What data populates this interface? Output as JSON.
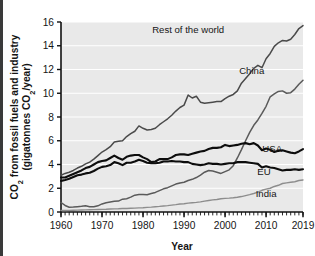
{
  "chart_data": {
    "type": "line",
    "title": "",
    "xlabel": "Year",
    "ylabel": "CO2 from fossil fuels and industry (gigatonnes CO2/year)",
    "ylabel_line1_pre": "CO",
    "ylabel_line1_sub": "2",
    "ylabel_line1_post": " from fossil fuels and industry",
    "ylabel_line2_pre": "(gigatonnes CO",
    "ylabel_line2_sub": "2",
    "ylabel_line2_post": "/year)",
    "xlim": [
      1960,
      2019
    ],
    "ylim": [
      0,
      16
    ],
    "xticks": [
      1960,
      1970,
      1980,
      1990,
      2000,
      2010,
      2019
    ],
    "xtick_labels": [
      "1960",
      "1970",
      "1980",
      "1990",
      "2000",
      "2010",
      "2019"
    ],
    "yticks": [
      0,
      2,
      4,
      6,
      8,
      10,
      12,
      14,
      16
    ],
    "ytick_labels": [
      "0",
      "2",
      "4",
      "6",
      "8",
      "10",
      "12",
      "14",
      "16"
    ],
    "grid": "horizontal",
    "grid_color": "#ffffff",
    "plot_background": "#e9e9e9",
    "legend_position": "inline-annotations",
    "minor_xticks": true,
    "x": [
      1960,
      1961,
      1962,
      1963,
      1964,
      1965,
      1966,
      1967,
      1968,
      1969,
      1970,
      1971,
      1972,
      1973,
      1974,
      1975,
      1976,
      1977,
      1978,
      1979,
      1980,
      1981,
      1982,
      1983,
      1984,
      1985,
      1986,
      1987,
      1988,
      1989,
      1990,
      1991,
      1992,
      1993,
      1994,
      1995,
      1996,
      1997,
      1998,
      1999,
      2000,
      2001,
      2002,
      2003,
      2004,
      2005,
      2006,
      2007,
      2008,
      2009,
      2010,
      2011,
      2012,
      2013,
      2014,
      2015,
      2016,
      2017,
      2018,
      2019
    ],
    "series": [
      {
        "name": "Rest of the world",
        "label": "Rest of the world",
        "color": "#4a4a4a",
        "width": 1.5,
        "label_x": 1991.0,
        "label_y": 15.1,
        "end_value": 15.7,
        "values": [
          3.1,
          3.25,
          3.35,
          3.5,
          3.7,
          3.85,
          4.05,
          4.2,
          4.45,
          4.75,
          5.05,
          5.25,
          5.5,
          5.9,
          5.95,
          6.0,
          6.35,
          6.6,
          6.8,
          7.25,
          7.05,
          6.9,
          6.95,
          7.05,
          7.35,
          7.6,
          7.85,
          8.15,
          8.5,
          8.8,
          9.0,
          9.85,
          9.6,
          9.75,
          9.25,
          9.15,
          9.2,
          9.25,
          9.3,
          9.3,
          9.55,
          9.75,
          9.9,
          10.2,
          10.85,
          11.25,
          11.65,
          12.1,
          12.35,
          12.15,
          12.9,
          13.35,
          13.95,
          14.25,
          14.45,
          14.4,
          14.55,
          14.95,
          15.45,
          15.7
        ]
      },
      {
        "name": "China",
        "label": "China",
        "color": "#5a5a5a",
        "width": 1.5,
        "label_x": 2006.5,
        "label_y": 11.6,
        "end_value": 11.1,
        "values": [
          0.8,
          0.55,
          0.4,
          0.42,
          0.45,
          0.48,
          0.52,
          0.45,
          0.44,
          0.52,
          0.68,
          0.78,
          0.84,
          0.9,
          0.92,
          1.08,
          1.12,
          1.25,
          1.42,
          1.47,
          1.47,
          1.45,
          1.55,
          1.65,
          1.8,
          1.95,
          2.05,
          2.2,
          2.35,
          2.45,
          2.5,
          2.65,
          2.75,
          2.9,
          3.1,
          3.35,
          3.5,
          3.45,
          3.35,
          3.25,
          3.4,
          3.55,
          3.9,
          4.55,
          5.25,
          6.0,
          6.7,
          7.3,
          7.75,
          8.3,
          8.9,
          9.7,
          9.95,
          10.15,
          10.2,
          10.0,
          10.05,
          10.35,
          10.75,
          11.1
        ]
      },
      {
        "name": "USA",
        "label": "USA",
        "color": "#0d0d0d",
        "width": 2.1,
        "label_x": 2011.5,
        "label_y": 5.05,
        "end_value": 5.3,
        "values": [
          2.9,
          2.9,
          3.05,
          3.2,
          3.35,
          3.5,
          3.7,
          3.8,
          4.0,
          4.2,
          4.3,
          4.35,
          4.55,
          4.75,
          4.55,
          4.4,
          4.65,
          4.75,
          4.8,
          4.8,
          4.6,
          4.45,
          4.2,
          4.25,
          4.45,
          4.45,
          4.45,
          4.6,
          4.8,
          4.85,
          4.85,
          4.8,
          4.9,
          5.0,
          5.1,
          5.15,
          5.3,
          5.4,
          5.4,
          5.45,
          5.65,
          5.55,
          5.6,
          5.65,
          5.75,
          5.8,
          5.7,
          5.8,
          5.6,
          5.2,
          5.35,
          5.25,
          5.05,
          5.15,
          5.2,
          5.1,
          5.0,
          4.95,
          5.1,
          5.3
        ]
      },
      {
        "name": "EU",
        "label": "EU",
        "color": "#0d0d0d",
        "width": 2.1,
        "label_x": 2009.5,
        "label_y": 3.1,
        "end_value": 3.6,
        "values": [
          2.62,
          2.7,
          2.8,
          2.95,
          3.1,
          3.15,
          3.25,
          3.3,
          3.45,
          3.65,
          3.8,
          3.85,
          3.95,
          4.2,
          4.1,
          3.95,
          4.15,
          4.15,
          4.25,
          4.4,
          4.3,
          4.15,
          4.1,
          4.1,
          4.15,
          4.25,
          4.25,
          4.3,
          4.25,
          4.25,
          4.2,
          4.2,
          4.05,
          4.0,
          3.95,
          4.0,
          4.1,
          4.05,
          4.05,
          4.0,
          4.05,
          4.1,
          4.1,
          4.2,
          4.2,
          4.2,
          4.15,
          4.1,
          4.05,
          3.75,
          3.85,
          3.75,
          3.7,
          3.6,
          3.5,
          3.55,
          3.55,
          3.6,
          3.55,
          3.6
        ]
      },
      {
        "name": "India",
        "label": "India",
        "color": "#8d8d8d",
        "width": 1.4,
        "label_x": 2010.0,
        "label_y": 1.3,
        "end_value": 2.7,
        "values": [
          0.12,
          0.13,
          0.14,
          0.15,
          0.16,
          0.17,
          0.18,
          0.19,
          0.2,
          0.21,
          0.22,
          0.23,
          0.25,
          0.26,
          0.27,
          0.29,
          0.3,
          0.32,
          0.33,
          0.35,
          0.36,
          0.39,
          0.41,
          0.44,
          0.47,
          0.51,
          0.54,
          0.58,
          0.62,
          0.67,
          0.7,
          0.75,
          0.78,
          0.81,
          0.85,
          0.92,
          0.97,
          1.02,
          1.05,
          1.12,
          1.15,
          1.17,
          1.2,
          1.24,
          1.3,
          1.38,
          1.46,
          1.56,
          1.68,
          1.83,
          1.93,
          2.0,
          2.15,
          2.25,
          2.4,
          2.45,
          2.5,
          2.55,
          2.65,
          2.7
        ]
      }
    ]
  }
}
